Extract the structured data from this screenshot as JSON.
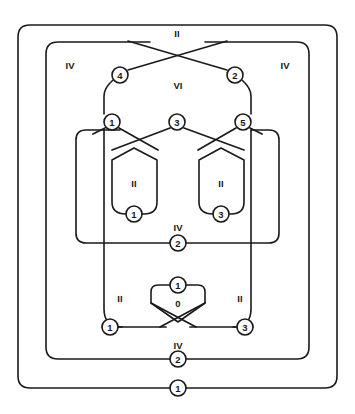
{
  "diagram": {
    "type": "nested-region-graph",
    "width": 355,
    "height": 414,
    "stroke_color": "#1a1a1a",
    "background_color": "#ffffff",
    "region_labels": [
      {
        "id": "region-ii-top",
        "text": "II",
        "x": 177,
        "y": 33
      },
      {
        "id": "region-iv-top-left",
        "text": "IV",
        "x": 70,
        "y": 65
      },
      {
        "id": "region-iv-top-right",
        "text": "IV",
        "x": 285,
        "y": 65
      },
      {
        "id": "region-vi-center",
        "text": "VI",
        "x": 178,
        "y": 85
      },
      {
        "id": "region-ii-box-left",
        "text": "II",
        "x": 134,
        "y": 183
      },
      {
        "id": "region-ii-box-right",
        "text": "II",
        "x": 221,
        "y": 183
      },
      {
        "id": "region-iv-middle",
        "text": "IV",
        "x": 178,
        "y": 227
      },
      {
        "id": "region-ii-lower-left",
        "text": "II",
        "x": 120,
        "y": 298
      },
      {
        "id": "region-ii-lower-right",
        "text": "II",
        "x": 240,
        "y": 298
      },
      {
        "id": "region-zero-inner",
        "text": "0",
        "x": 178,
        "y": 303
      },
      {
        "id": "region-iv-bottom",
        "text": "IV",
        "x": 178,
        "y": 345
      }
    ],
    "nodes": [
      {
        "id": "node-4-upper-left",
        "label": "4",
        "x": 120,
        "y": 75,
        "r": 8
      },
      {
        "id": "node-2-upper-right",
        "label": "2",
        "x": 235,
        "y": 75,
        "r": 8
      },
      {
        "id": "node-1-mid-left",
        "label": "1",
        "x": 112,
        "y": 122,
        "r": 8
      },
      {
        "id": "node-3-mid-center",
        "label": "3",
        "x": 177,
        "y": 122,
        "r": 8
      },
      {
        "id": "node-5-mid-right",
        "label": "5",
        "x": 243,
        "y": 122,
        "r": 8
      },
      {
        "id": "node-1-box-left",
        "label": "1",
        "x": 134,
        "y": 214,
        "r": 8
      },
      {
        "id": "node-3-box-right",
        "label": "3",
        "x": 221,
        "y": 214,
        "r": 8
      },
      {
        "id": "node-2-middle-iv",
        "label": "2",
        "x": 178,
        "y": 243,
        "r": 8
      },
      {
        "id": "node-1-zero-top",
        "label": "1",
        "x": 178,
        "y": 285,
        "r": 8
      },
      {
        "id": "node-1-lower-left",
        "label": "1",
        "x": 110,
        "y": 327,
        "r": 8
      },
      {
        "id": "node-3-lower-right",
        "label": "3",
        "x": 245,
        "y": 327,
        "r": 8
      },
      {
        "id": "node-2-bottom-iv",
        "label": "2",
        "x": 178,
        "y": 359,
        "r": 8
      },
      {
        "id": "node-1-outer-bottom",
        "label": "1",
        "x": 178,
        "y": 388,
        "r": 8
      }
    ],
    "regions": [
      {
        "id": "outer-boundary-1",
        "label": "II",
        "note": "outermost rounded rectangle"
      },
      {
        "id": "boundary-iv-2",
        "label": "IV",
        "note": "second rounded rectangle"
      },
      {
        "id": "boundary-vi-3",
        "label": "VI",
        "note": "third region, pointed top with crossing"
      },
      {
        "id": "boundary-iv-4",
        "label": "IV",
        "note": "fourth region containing the two II boxes"
      },
      {
        "id": "box-ii-left",
        "label": "II",
        "note": "left pentagon box"
      },
      {
        "id": "box-ii-right",
        "label": "II",
        "note": "right pentagon box"
      },
      {
        "id": "box-zero",
        "label": "0",
        "note": "small lower box with crossing tails"
      }
    ]
  }
}
